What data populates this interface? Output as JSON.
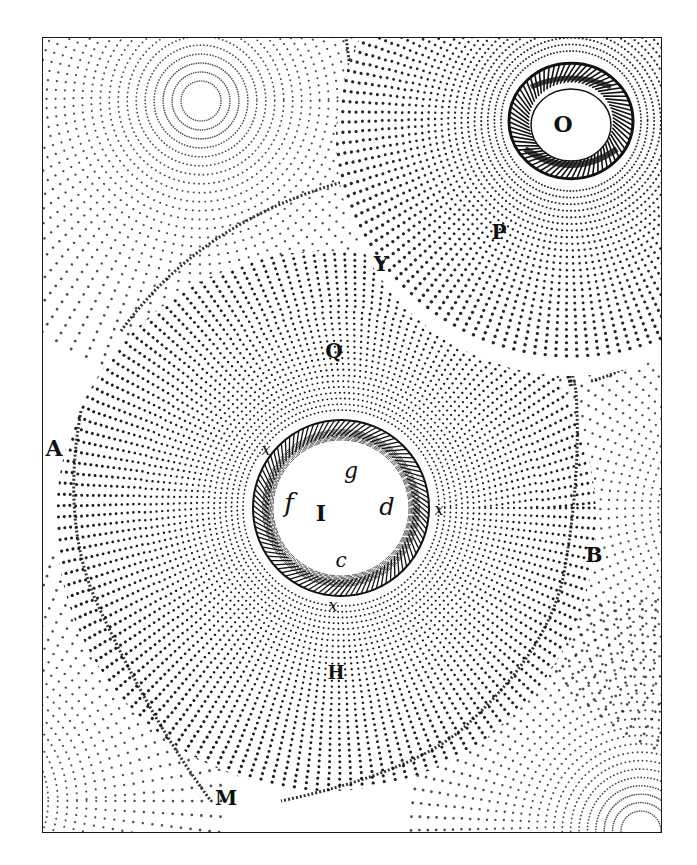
{
  "figure": {
    "frame": {
      "x": 42,
      "y": 37,
      "width": 620,
      "height": 796
    },
    "ink_color": "#111111",
    "paper_color": "#ffffff",
    "vortices": [
      {
        "id": "S",
        "name": "central-vortex",
        "cx": 280,
        "cy": 480,
        "r_max": 270,
        "rings": 34
      },
      {
        "id": "O",
        "name": "upper-right-vortex",
        "cx": 565,
        "cy": 130,
        "r_max": 230,
        "rings": 28
      },
      {
        "id": "upper-left",
        "name": "upper-left-vortex",
        "cx": 200,
        "cy": 100,
        "r_max": 280,
        "rings": 30
      },
      {
        "id": "right",
        "name": "right-vortex",
        "cx": 760,
        "cy": 510,
        "r_max": 260,
        "rings": 30
      },
      {
        "id": "lower-right",
        "name": "lower-right-vortex",
        "cx": 640,
        "cy": 830,
        "r_max": 230,
        "rings": 26
      },
      {
        "id": "lower-left",
        "name": "lower-left-vortex",
        "cx": -40,
        "cy": 800,
        "r_max": 260,
        "rings": 26
      }
    ],
    "labels": [
      {
        "text": "O",
        "x": 562,
        "y": 131,
        "size": 22,
        "italic": false
      },
      {
        "text": "P",
        "x": 498,
        "y": 238,
        "size": 20,
        "italic": false
      },
      {
        "text": "Y",
        "x": 380,
        "y": 270,
        "size": 20,
        "italic": false
      },
      {
        "text": "Q",
        "x": 333,
        "y": 357,
        "size": 20,
        "italic": false
      },
      {
        "text": "A",
        "x": 53,
        "y": 455,
        "size": 22,
        "italic": false
      },
      {
        "text": "x",
        "x": 265,
        "y": 454,
        "size": 16,
        "italic": true
      },
      {
        "text": "g",
        "x": 350,
        "y": 477,
        "size": 22,
        "italic": true
      },
      {
        "text": "f",
        "x": 288,
        "y": 511,
        "size": 26,
        "italic": true
      },
      {
        "text": "I",
        "x": 320,
        "y": 520,
        "size": 22,
        "italic": false
      },
      {
        "text": "d",
        "x": 386,
        "y": 514,
        "size": 24,
        "italic": true
      },
      {
        "text": "x",
        "x": 438,
        "y": 514,
        "size": 16,
        "italic": true
      },
      {
        "text": "c",
        "x": 340,
        "y": 566,
        "size": 20,
        "italic": true
      },
      {
        "text": "x",
        "x": 332,
        "y": 610,
        "size": 16,
        "italic": true
      },
      {
        "text": "B",
        "x": 593,
        "y": 561,
        "size": 20,
        "italic": false
      },
      {
        "text": "H",
        "x": 335,
        "y": 678,
        "size": 18,
        "italic": false
      },
      {
        "text": "M",
        "x": 225,
        "y": 804,
        "size": 20,
        "italic": false
      }
    ],
    "sun_disk": {
      "cx": 340,
      "cy": 507,
      "r_inner": 68,
      "r_band": 86
    },
    "star_O": {
      "cx": 570,
      "cy": 120,
      "r_inner": 42,
      "r_band": 62
    }
  }
}
